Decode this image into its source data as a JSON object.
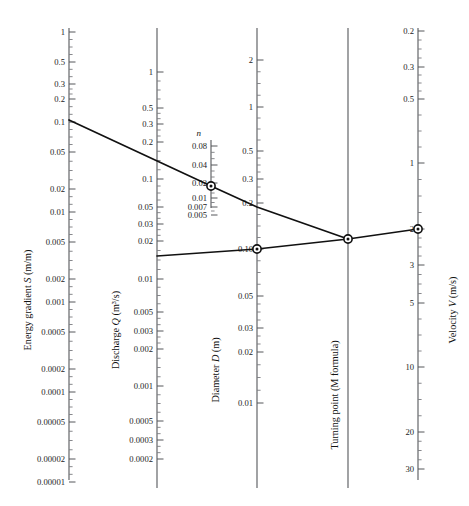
{
  "figure": {
    "type": "nomogram",
    "width": 469,
    "height": 506,
    "background": "#ffffff",
    "line_color": "#111111",
    "axis_color": "#55565a"
  },
  "scales": [
    {
      "id": "energy-gradient",
      "title_plain": "Energy gradient S (m/m)",
      "title_pre": "Energy gradient ",
      "title_italic": "S",
      "title_post": " (m/m)",
      "x": 69,
      "label_side": "left",
      "top_value": 1,
      "bottom_value": 1e-05,
      "direction": "descending",
      "y_top": 28,
      "y_bottom": 480,
      "ticks": [
        {
          "label": "1",
          "value": 1,
          "y": 32
        },
        {
          "label": "0.5",
          "value": 0.5,
          "y": 62
        },
        {
          "label": "0.3",
          "value": 0.3,
          "y": 84
        },
        {
          "label": "0.2",
          "value": 0.2,
          "y": 99
        },
        {
          "label": "0.1",
          "value": 0.1,
          "y": 122
        },
        {
          "label": "0.05",
          "value": 0.05,
          "y": 152
        },
        {
          "label": "0.02",
          "value": 0.02,
          "y": 189
        },
        {
          "label": "0.01",
          "value": 0.01,
          "y": 212
        },
        {
          "label": "0.005",
          "value": 0.005,
          "y": 242
        },
        {
          "label": "0.002",
          "value": 0.002,
          "y": 279
        },
        {
          "label": "0.001",
          "value": 0.001,
          "y": 302
        },
        {
          "label": "0.0005",
          "value": 0.0005,
          "y": 332
        },
        {
          "label": "0.0002",
          "value": 0.0002,
          "y": 369
        },
        {
          "label": "0.0001",
          "value": 0.0001,
          "y": 392
        },
        {
          "label": "0.00005",
          "value": 5e-05,
          "y": 422
        },
        {
          "label": "0.00002",
          "value": 2e-05,
          "y": 459
        },
        {
          "label": "0.00001",
          "value": 1e-05,
          "y": 482
        }
      ]
    },
    {
      "id": "discharge",
      "title_plain": "Discharge Q (m3/s)",
      "title_pre": "Discharge ",
      "title_italic": "Q",
      "title_post": " (m³/s)",
      "x": 157,
      "label_side": "left",
      "top_value": 1,
      "bottom_value": 0.0002,
      "direction": "descending",
      "y_top": 28,
      "y_bottom": 488,
      "ticks": [
        {
          "label": "1",
          "value": 1,
          "y": 72
        },
        {
          "label": "0.5",
          "value": 0.5,
          "y": 108
        },
        {
          "label": "0.3",
          "value": 0.3,
          "y": 124
        },
        {
          "label": "0.2",
          "value": 0.2,
          "y": 142
        },
        {
          "label": "0.1",
          "value": 0.1,
          "y": 179
        },
        {
          "label": "0.05",
          "value": 0.05,
          "y": 207
        },
        {
          "label": "0.03",
          "value": 0.03,
          "y": 224
        },
        {
          "label": "0.02",
          "value": 0.02,
          "y": 241
        },
        {
          "label": "0.01",
          "value": 0.01,
          "y": 279
        },
        {
          "label": "0.005",
          "value": 0.005,
          "y": 312
        },
        {
          "label": "0.003",
          "value": 0.003,
          "y": 331
        },
        {
          "label": "0.002",
          "value": 0.002,
          "y": 349
        },
        {
          "label": "0.001",
          "value": 0.001,
          "y": 386
        },
        {
          "label": "0.0005",
          "value": 0.0005,
          "y": 421
        },
        {
          "label": "0.0003",
          "value": 0.0003,
          "y": 440
        },
        {
          "label": "0.0002",
          "value": 0.0002,
          "y": 459
        }
      ]
    },
    {
      "id": "roughness",
      "title_plain": "n",
      "title_pre": "",
      "title_italic": "n",
      "title_post": "",
      "x": 211,
      "label_side": "left",
      "top_value": 0.08,
      "bottom_value": 0.005,
      "direction": "descending",
      "y_top": 140,
      "y_bottom": 208,
      "ticks": [
        {
          "label": "0.08",
          "value": 0.08,
          "y": 146
        },
        {
          "label": "0.04",
          "value": 0.04,
          "y": 165
        },
        {
          "label": "0.02",
          "value": 0.02,
          "y": 183
        },
        {
          "label": "0.01",
          "value": 0.01,
          "y": 198
        },
        {
          "label": "0.007",
          "value": 0.007,
          "y": 207
        },
        {
          "label": "0.005",
          "value": 0.005,
          "y": 215
        }
      ]
    },
    {
      "id": "diameter",
      "title_plain": "Diameter D (m)",
      "title_pre": "Diameter ",
      "title_italic": "D",
      "title_post": " (m)",
      "x": 257,
      "label_side": "right",
      "top_value": 2,
      "bottom_value": 0.01,
      "direction": "descending",
      "y_top": 28,
      "y_bottom": 488,
      "ticks": [
        {
          "label": "2",
          "value": 2,
          "y": 60
        },
        {
          "label": "1",
          "value": 1,
          "y": 107
        },
        {
          "label": "0.5",
          "value": 0.5,
          "y": 151
        },
        {
          "label": "0.3",
          "value": 0.3,
          "y": 179
        },
        {
          "label": "0.2",
          "value": 0.2,
          "y": 203
        },
        {
          "label": "0.10",
          "value": 0.1,
          "y": 249
        },
        {
          "label": "0.05",
          "value": 0.05,
          "y": 296
        },
        {
          "label": "0.03",
          "value": 0.03,
          "y": 328
        },
        {
          "label": "0.02",
          "value": 0.02,
          "y": 352
        },
        {
          "label": "0.01",
          "value": 0.01,
          "y": 403
        }
      ]
    },
    {
      "id": "turning-point",
      "title_plain": "Turning point (M formula)",
      "title_pre": "Turning point (M formula)",
      "title_italic": "",
      "title_post": "",
      "x": 348,
      "label_side": "none",
      "direction": "none",
      "y_top": 28,
      "y_bottom": 488,
      "ticks": []
    },
    {
      "id": "velocity",
      "title_plain": "Velocity V (m/s)",
      "title_pre": "Velocity ",
      "title_italic": "V",
      "title_post": " (m/s)",
      "x": 418,
      "label_side": "right",
      "top_value": 0.2,
      "bottom_value": 30,
      "direction": "ascending",
      "y_top": 28,
      "y_bottom": 480,
      "ticks": [
        {
          "label": "0.2",
          "value": 0.2,
          "y": 31
        },
        {
          "label": "0.3",
          "value": 0.3,
          "y": 67
        },
        {
          "label": "0.5",
          "value": 0.5,
          "y": 99
        },
        {
          "label": "1",
          "value": 1,
          "y": 163
        },
        {
          "label": "2",
          "value": 2,
          "y": 229
        },
        {
          "label": "3",
          "value": 3,
          "y": 265
        },
        {
          "label": "5",
          "value": 5,
          "y": 303
        },
        {
          "label": "10",
          "value": 10,
          "y": 367
        },
        {
          "label": "20",
          "value": 20,
          "y": 432
        },
        {
          "label": "30",
          "value": 30,
          "y": 469
        }
      ]
    }
  ],
  "solution_lines": [
    {
      "id": "upper-solution-line",
      "description": "Energy gradient S to roughness n to turning point",
      "points": [
        {
          "x": 69,
          "y": 120
        },
        {
          "x": 211,
          "y": 186
        },
        {
          "x": 257,
          "y": 207
        },
        {
          "x": 348,
          "y": 239
        }
      ]
    },
    {
      "id": "lower-solution-line",
      "description": "Discharge Q to diameter D to turning point to velocity V",
      "points": [
        {
          "x": 157,
          "y": 256
        },
        {
          "x": 257,
          "y": 249
        },
        {
          "x": 348,
          "y": 239
        },
        {
          "x": 418,
          "y": 229
        }
      ]
    }
  ],
  "markers": [
    {
      "id": "marker-roughness",
      "scale": "roughness",
      "x": 211,
      "y": 186,
      "reading": "0.015"
    },
    {
      "id": "marker-diameter",
      "scale": "diameter",
      "x": 257,
      "y": 249,
      "reading": "0.10"
    },
    {
      "id": "marker-turning-point",
      "scale": "turning-point",
      "x": 348,
      "y": 239,
      "reading": ""
    },
    {
      "id": "marker-velocity",
      "scale": "velocity",
      "x": 418,
      "y": 229,
      "reading": "2"
    }
  ]
}
